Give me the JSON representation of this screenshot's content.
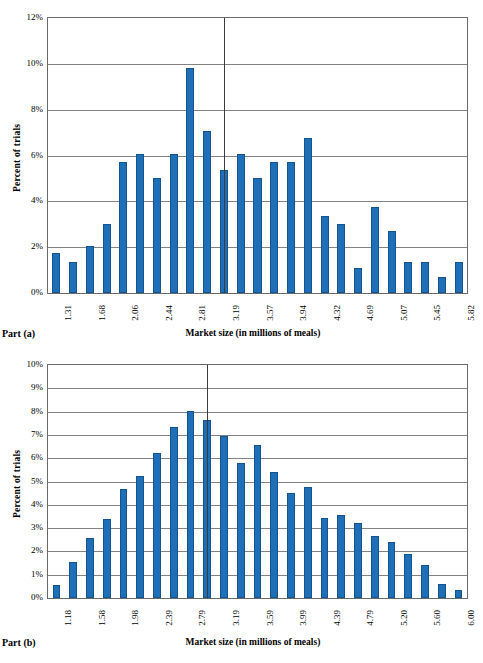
{
  "figure_a": {
    "part_label": "Part (a)",
    "xlabel": "Market size (in millions of meals)",
    "ylabel": "Percent of trials",
    "ytick_labels": [
      "12%",
      "10%",
      "8%",
      "6%",
      "4%",
      "2%",
      "0%"
    ],
    "xtick_labels": [
      "1.31",
      "1.68",
      "2.06",
      "2.44",
      "2.81",
      "3.19",
      "3.57",
      "3.94",
      "4.32",
      "4.69",
      "5.07",
      "5.45",
      "5.82"
    ]
  },
  "figure_b": {
    "part_label": "Part (b)",
    "xlabel": "Market size (in millions of meals)",
    "ylabel": "Percent of trials",
    "ytick_labels": [
      "10%",
      "9%",
      "8%",
      "7%",
      "6%",
      "5%",
      "4%",
      "3%",
      "2%",
      "1%",
      "0%"
    ],
    "xtick_labels": [
      "1.18",
      "1.58",
      "1.98",
      "2.39",
      "2.79",
      "3.19",
      "3.59",
      "3.99",
      "4.39",
      "4.79",
      "5.20",
      "5.60",
      "6.00"
    ]
  },
  "colors": {
    "bar": "#1F6FB8",
    "bar_edge": "#14558F",
    "grid": "#828282",
    "axis": "#6A6A6A",
    "reference_line": "#3B3B3B",
    "background": "#FFFFFF"
  },
  "chart_data": [
    {
      "type": "bar",
      "id": "part-a",
      "title": "",
      "xlabel": "Market size (in millions of meals)",
      "ylabel": "Percent of trials",
      "ylim": [
        0,
        12
      ],
      "yticks": [
        0,
        2,
        4,
        6,
        8,
        10,
        12
      ],
      "ytick_labels": [
        "0%",
        "2%",
        "4%",
        "6%",
        "8%",
        "10%",
        "12%"
      ],
      "grid": true,
      "legend": "none",
      "x_is_bin_start": true,
      "xtick_labels": [
        "1.31",
        "1.68",
        "2.06",
        "2.44",
        "2.81",
        "3.19",
        "3.57",
        "3.94",
        "4.32",
        "4.69",
        "5.07",
        "5.45",
        "5.82"
      ],
      "xtick_every_n_bars": 2,
      "categories": [
        "1.31",
        "1.50",
        "1.68",
        "1.87",
        "2.06",
        "2.25",
        "2.44",
        "2.63",
        "2.81",
        "3.00",
        "3.19",
        "3.38",
        "3.57",
        "3.76",
        "3.94",
        "4.13",
        "4.32",
        "4.51",
        "4.69",
        "4.88",
        "5.07",
        "5.26",
        "5.45",
        "5.64",
        "5.82"
      ],
      "values": [
        1.75,
        1.35,
        2.05,
        3.0,
        5.7,
        6.05,
        5.0,
        6.05,
        9.8,
        7.05,
        5.35,
        6.05,
        5.0,
        5.7,
        5.7,
        6.75,
        3.35,
        3.0,
        1.1,
        3.75,
        2.7,
        1.35,
        1.35,
        0.7,
        1.35
      ],
      "annotations": [
        {
          "type": "vertical-reference-line",
          "x_category_index": 10.5,
          "x_value": "3.19",
          "label": ""
        }
      ]
    },
    {
      "type": "bar",
      "id": "part-b",
      "title": "",
      "xlabel": "Market size (in millions of meals)",
      "ylabel": "Percent of trials",
      "ylim": [
        0,
        10
      ],
      "yticks": [
        0,
        1,
        2,
        3,
        4,
        5,
        6,
        7,
        8,
        9,
        10
      ],
      "ytick_labels": [
        "0%",
        "1%",
        "2%",
        "3%",
        "4%",
        "5%",
        "6%",
        "7%",
        "8%",
        "9%",
        "10%"
      ],
      "grid": true,
      "legend": "none",
      "x_is_bin_start": true,
      "xtick_labels": [
        "1.18",
        "1.58",
        "1.98",
        "2.39",
        "2.79",
        "3.19",
        "3.59",
        "3.99",
        "4.39",
        "4.79",
        "5.20",
        "5.60",
        "6.00"
      ],
      "xtick_every_n_bars": 2,
      "categories": [
        "1.18",
        "1.38",
        "1.58",
        "1.78",
        "1.98",
        "2.18",
        "2.39",
        "2.59",
        "2.79",
        "2.99",
        "3.19",
        "3.39",
        "3.59",
        "3.79",
        "3.99",
        "4.19",
        "4.39",
        "4.59",
        "4.79",
        "4.99",
        "5.20",
        "5.40",
        "5.60",
        "5.80",
        "6.00"
      ],
      "values": [
        0.55,
        1.55,
        2.58,
        3.4,
        4.67,
        5.23,
        6.22,
        7.35,
        8.03,
        7.62,
        6.97,
        5.8,
        6.57,
        5.4,
        4.5,
        4.78,
        3.45,
        3.55,
        3.2,
        2.68,
        2.4,
        1.88,
        1.4,
        0.6,
        0.33
      ],
      "annotations": [
        {
          "type": "vertical-reference-line",
          "x_category_index": 9.5,
          "x_value": "3.19",
          "label": ""
        }
      ]
    }
  ]
}
